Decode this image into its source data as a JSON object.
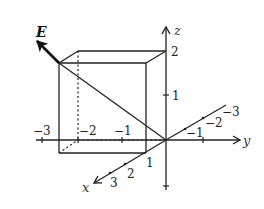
{
  "diagram": {
    "type": "3d-coordinate-box",
    "vector_label": "E",
    "axes": {
      "x": {
        "label": "x",
        "ticks": [
          "1",
          "2",
          "3"
        ],
        "neg_ticks": [
          "−1",
          "−2",
          "−3"
        ]
      },
      "y": {
        "label": "y",
        "ticks": [
          "1"
        ],
        "neg_ticks": [
          "−1",
          "−2",
          "−3"
        ]
      },
      "z": {
        "label": "z",
        "ticks": [
          "1",
          "2"
        ]
      }
    },
    "labels": {
      "z2": "2",
      "z1": "1",
      "y_neg3": "−3",
      "y_neg2": "−2",
      "y_neg1": "−1",
      "x1": "1",
      "x2": "2",
      "x3": "3",
      "xneg1": "−1",
      "xneg2": "−2",
      "xneg3": "−3"
    },
    "box": {
      "x": [
        0,
        1
      ],
      "y": [
        -2,
        0
      ],
      "z": [
        0,
        2
      ]
    },
    "line": "diagonal from corner (1,-2,2) to origin",
    "vector": "E at corner (1,-2,2) pointing outward along diagonal"
  }
}
